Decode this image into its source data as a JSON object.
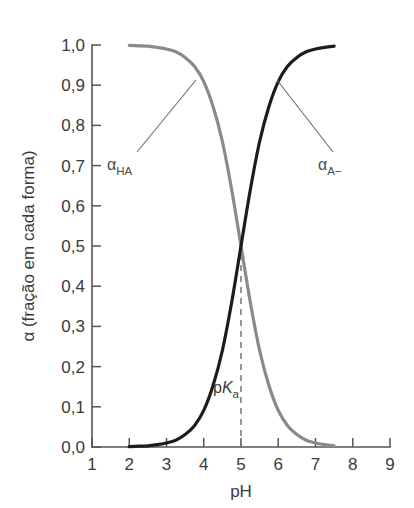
{
  "chart_data": {
    "type": "line",
    "title": "",
    "xlabel": "pH",
    "ylabel": "α (fração em cada forma)",
    "xlim": [
      1,
      9
    ],
    "ylim": [
      0.0,
      1.0
    ],
    "grid": false,
    "legend_position": "inline-annotations",
    "decimal_separator": ",",
    "x_ticks": [
      "1",
      "2",
      "3",
      "4",
      "5",
      "6",
      "7",
      "8",
      "9"
    ],
    "y_ticks": [
      "0,0",
      "0,1",
      "0,2",
      "0,3",
      "0,4",
      "0,5",
      "0,6",
      "0,7",
      "0,8",
      "0,9",
      "1,0"
    ],
    "x": [
      2.0,
      2.25,
      2.5,
      2.75,
      3.0,
      3.25,
      3.5,
      3.75,
      4.0,
      4.25,
      4.5,
      4.75,
      5.0,
      5.25,
      5.5,
      5.75,
      6.0,
      6.25,
      6.5,
      6.75,
      7.0,
      7.25,
      7.5
    ],
    "series": [
      {
        "name": "αHA",
        "label": "α",
        "subscript": "HA",
        "color": "#8a8a8a",
        "values": [
          0.999,
          0.998,
          0.997,
          0.994,
          0.99,
          0.983,
          0.969,
          0.947,
          0.909,
          0.847,
          0.76,
          0.64,
          0.5,
          0.36,
          0.24,
          0.153,
          0.091,
          0.053,
          0.031,
          0.017,
          0.01,
          0.006,
          0.003
        ]
      },
      {
        "name": "αA-",
        "label": "α",
        "subscript": "A−",
        "color": "#1c1c1c",
        "values": [
          0.001,
          0.002,
          0.003,
          0.006,
          0.01,
          0.017,
          0.031,
          0.053,
          0.091,
          0.153,
          0.24,
          0.36,
          0.5,
          0.64,
          0.76,
          0.847,
          0.909,
          0.947,
          0.969,
          0.983,
          0.99,
          0.994,
          0.997
        ]
      }
    ],
    "annotations": [
      {
        "name": "pKa-marker",
        "text": "pK",
        "subscript": "a",
        "x": 5.0,
        "y_from": 0.0,
        "y_to": 0.5,
        "style": "dashed-vertical"
      }
    ]
  }
}
